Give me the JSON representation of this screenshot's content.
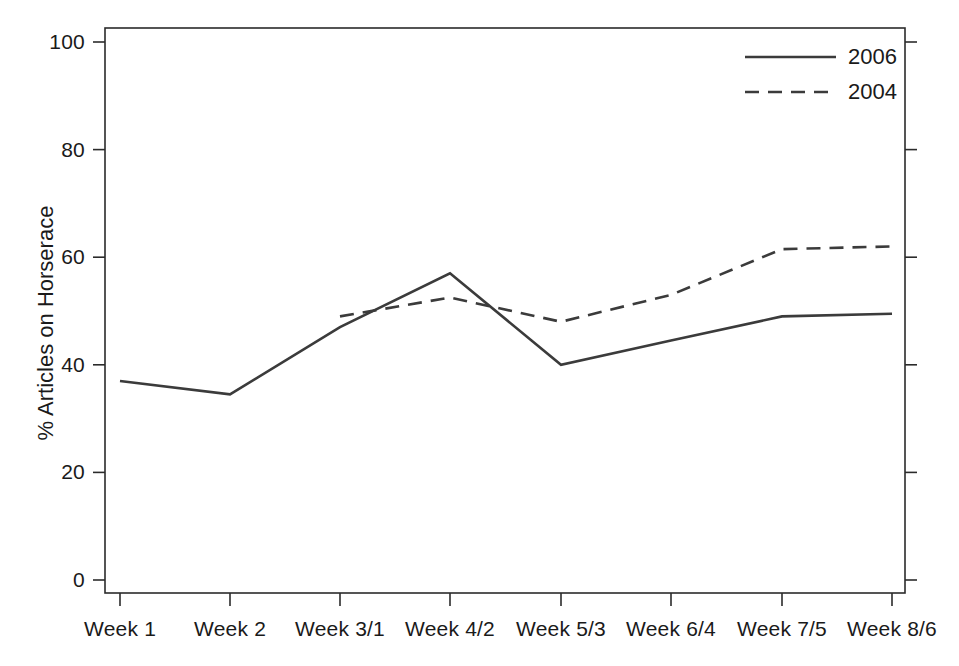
{
  "chart_data": {
    "type": "line",
    "title": "",
    "subtitle": "",
    "xlabel": "",
    "ylabel": "% Articles on Horserace",
    "categories": [
      "Week 1",
      "Week 2",
      "Week 3/1",
      "Week 4/2",
      "Week 5/3",
      "Week 6/4",
      "Week 7/5",
      "Week 8/6"
    ],
    "series": [
      {
        "name": "2006",
        "style": "solid",
        "color": "#3b3b3b",
        "values": [
          37,
          34.5,
          47,
          57,
          40,
          44.5,
          49,
          49.5
        ]
      },
      {
        "name": "2004",
        "style": "dashed",
        "color": "#3b3b3b",
        "values": [
          null,
          null,
          49,
          52.5,
          48,
          53,
          61.5,
          62
        ]
      }
    ],
    "ylim": [
      0,
      103
    ],
    "yticks": [
      0,
      20,
      40,
      60,
      80,
      100
    ],
    "ytick_labels": [
      "0",
      "20",
      "40",
      "60",
      "80",
      "100"
    ],
    "grid": false,
    "legend_position": "top-right",
    "axis_color": "#2b2b2b",
    "background": "#ffffff"
  },
  "legend": {
    "entries": [
      {
        "label": "2006",
        "style": "solid"
      },
      {
        "label": "2004",
        "style": "dashed"
      }
    ]
  }
}
